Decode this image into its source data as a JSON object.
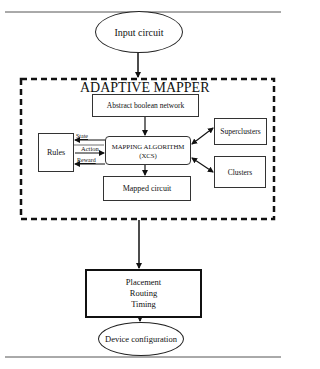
{
  "diagram": {
    "type": "flowchart",
    "nodes": {
      "input": {
        "label": "Input circuit",
        "shape": "ellipse"
      },
      "group_title": "ADAPTIVE MAPPER",
      "abstract": {
        "label": "Abstract boolean network",
        "shape": "rect"
      },
      "rules": {
        "label": "Rules",
        "shape": "rect"
      },
      "mapping": {
        "label_line1": "MAPPING ALGORITHM",
        "label_line2": "(XCS)",
        "shape": "rounded-rect"
      },
      "superclusters": {
        "label": "Superclusters",
        "shape": "rect"
      },
      "clusters": {
        "label": "Clusters",
        "shape": "rect"
      },
      "mapped": {
        "label": "Mapped circuit",
        "shape": "rect"
      },
      "par": {
        "line1": "Placement",
        "line2": "Routing",
        "line3": "Timing",
        "shape": "rect-bold"
      },
      "device": {
        "label": "Device configuration",
        "shape": "ellipse"
      }
    },
    "edge_labels": {
      "state": "State",
      "action": "Action",
      "reward": "Reward"
    },
    "edges": [
      {
        "from": "Input circuit",
        "to": "ADAPTIVE MAPPER"
      },
      {
        "from": "Abstract boolean network",
        "to": "MAPPING ALGORITHM (XCS)"
      },
      {
        "from": "MAPPING ALGORITHM (XCS)",
        "to": "Rules",
        "label": "State"
      },
      {
        "from": "Rules",
        "to": "MAPPING ALGORITHM (XCS)",
        "label": "Action"
      },
      {
        "from": "MAPPING ALGORITHM (XCS)",
        "to": "Rules",
        "label": "Reward"
      },
      {
        "from": "MAPPING ALGORITHM (XCS)",
        "to": "Superclusters",
        "bidirectional": true
      },
      {
        "from": "MAPPING ALGORITHM (XCS)",
        "to": "Clusters",
        "bidirectional": true
      },
      {
        "from": "MAPPING ALGORITHM (XCS)",
        "to": "Mapped circuit"
      },
      {
        "from": "ADAPTIVE MAPPER",
        "to": "Placement Routing Timing"
      },
      {
        "from": "Placement Routing Timing",
        "to": "Device configuration"
      }
    ]
  }
}
